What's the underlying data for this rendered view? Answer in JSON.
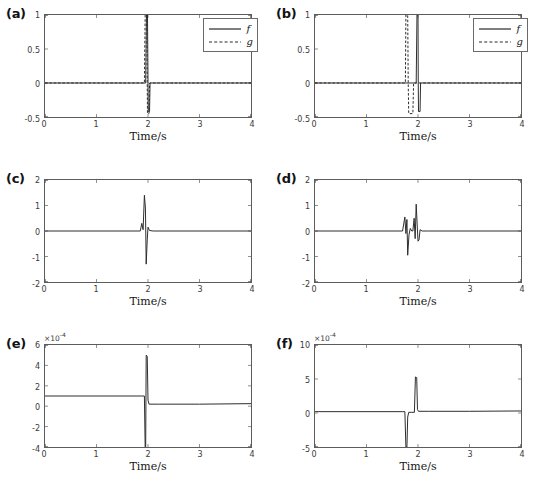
{
  "figure": {
    "background_color": "#ffffff",
    "line_color": "#2b2b2b",
    "axis_color": "#5c5c5c",
    "panel_count": 6,
    "shared_xlabel": "Time/s"
  },
  "chart_data": [
    {
      "type": "line",
      "panel": "(a)",
      "title": "",
      "xlabel": "Time/s",
      "ylabel": "",
      "xlim": [
        0,
        4
      ],
      "ylim": [
        -0.5,
        1
      ],
      "xticks": [
        "0",
        "1",
        "2",
        "3",
        "4"
      ],
      "xtick_values": [
        0,
        1,
        2,
        3,
        4
      ],
      "yticks": [
        "1",
        "0.5",
        "0",
        "-0.5"
      ],
      "ytick_values": [
        1,
        0.5,
        0,
        -0.5
      ],
      "grid": false,
      "exponent": "",
      "legend": {
        "position": "upper-right",
        "entries": [
          {
            "label": "f",
            "style": "solid"
          },
          {
            "label": "g",
            "style": "dashed"
          }
        ]
      },
      "series": [
        {
          "name": "f",
          "style": "solid",
          "description": "Flat zero baseline with a narrow clipped impulse at t=2.0; rises beyond +1 (clipped at axis top) then swings to about -0.42 before returning to zero.",
          "points": [
            [
              0.0,
              0.0
            ],
            [
              1.9,
              0.0
            ],
            [
              1.955,
              0.0
            ],
            [
              1.97,
              1.0
            ],
            [
              1.99,
              1.0
            ],
            [
              2.0,
              0.02
            ],
            [
              2.005,
              -0.42
            ],
            [
              2.03,
              -0.42
            ],
            [
              2.04,
              0.0
            ],
            [
              2.2,
              0.0
            ],
            [
              4.0,
              0.0
            ]
          ]
        },
        {
          "name": "g",
          "style": "dashed",
          "description": "Nearly coincident with f; narrow clipped impulse centred at t=1.96 reaching beyond +1 and dipping to about -0.45.",
          "points": [
            [
              0.0,
              0.0
            ],
            [
              1.88,
              0.0
            ],
            [
              1.93,
              0.0
            ],
            [
              1.945,
              1.0
            ],
            [
              1.975,
              1.0
            ],
            [
              1.985,
              0.0
            ],
            [
              1.99,
              -0.45
            ],
            [
              2.02,
              -0.45
            ],
            [
              2.03,
              0.0
            ],
            [
              2.2,
              0.0
            ],
            [
              4.0,
              0.0
            ]
          ]
        }
      ]
    },
    {
      "type": "line",
      "panel": "(b)",
      "title": "",
      "xlabel": "Time/s",
      "ylabel": "",
      "xlim": [
        0,
        4
      ],
      "ylim": [
        -0.5,
        1
      ],
      "xticks": [
        "0",
        "1",
        "2",
        "3",
        "4"
      ],
      "xtick_values": [
        0,
        1,
        2,
        3,
        4
      ],
      "yticks": [
        "1",
        "0.5",
        "0",
        "-0.5"
      ],
      "ytick_values": [
        1,
        0.5,
        0,
        -0.5
      ],
      "grid": false,
      "exponent": "",
      "legend": {
        "position": "upper-right",
        "entries": [
          {
            "label": "f",
            "style": "solid"
          },
          {
            "label": "g",
            "style": "dashed"
          }
        ]
      },
      "series": [
        {
          "name": "f",
          "style": "solid",
          "description": "Zero baseline with clipped impulse at t=2.0 reaching past +1 then dipping to about -0.42.",
          "points": [
            [
              0.0,
              0.0
            ],
            [
              1.93,
              0.0
            ],
            [
              1.965,
              0.0
            ],
            [
              1.98,
              1.0
            ],
            [
              2.0,
              1.0
            ],
            [
              2.005,
              0.0
            ],
            [
              2.01,
              -0.42
            ],
            [
              2.04,
              -0.42
            ],
            [
              2.05,
              0.0
            ],
            [
              2.25,
              0.0
            ],
            [
              4.0,
              0.0
            ]
          ]
        },
        {
          "name": "g",
          "style": "dashed",
          "description": "Time-shifted copy of f; clipped impulse centred near t=1.80, reaching past +1 then oscillating down to about -0.45 between t=1.80 and t=1.92.",
          "points": [
            [
              0.0,
              0.0
            ],
            [
              1.72,
              0.0
            ],
            [
              1.755,
              0.0
            ],
            [
              1.765,
              1.0
            ],
            [
              1.8,
              1.0
            ],
            [
              1.81,
              0.0
            ],
            [
              1.82,
              -0.45
            ],
            [
              1.9,
              -0.45
            ],
            [
              1.915,
              0.0
            ],
            [
              2.1,
              0.0
            ],
            [
              4.0,
              0.0
            ]
          ]
        }
      ]
    },
    {
      "type": "line",
      "panel": "(c)",
      "title": "",
      "xlabel": "Time/s",
      "ylabel": "",
      "xlim": [
        0,
        4
      ],
      "ylim": [
        -2,
        2
      ],
      "xticks": [
        "0",
        "1",
        "2",
        "3",
        "4"
      ],
      "xtick_values": [
        0,
        1,
        2,
        3,
        4
      ],
      "yticks": [
        "2",
        "1",
        "0",
        "-1",
        "-2"
      ],
      "ytick_values": [
        2,
        1,
        0,
        -1,
        -2
      ],
      "grid": false,
      "exponent": "",
      "legend": null,
      "series": [
        {
          "name": "c",
          "style": "solid",
          "description": "Flat zero baseline then a single oscillatory transient near t=1.95: small positive lobe of 0.3, main positive peak of 1.4, deep negative trough of -1.3, small recovery lobe of 0.15, back to zero.",
          "points": [
            [
              0.0,
              0.0
            ],
            [
              1.85,
              0.0
            ],
            [
              1.88,
              0.3
            ],
            [
              1.905,
              0.05
            ],
            [
              1.93,
              1.4
            ],
            [
              1.95,
              0.9
            ],
            [
              1.965,
              -1.3
            ],
            [
              1.985,
              -0.35
            ],
            [
              2.0,
              0.15
            ],
            [
              2.03,
              0.02
            ],
            [
              2.1,
              0.0
            ],
            [
              4.0,
              0.0
            ]
          ]
        }
      ]
    },
    {
      "type": "line",
      "panel": "(d)",
      "title": "",
      "xlabel": "Time/s",
      "ylabel": "",
      "xlim": [
        0,
        4
      ],
      "ylim": [
        -2,
        2
      ],
      "xticks": [
        "0",
        "1",
        "2",
        "3",
        "4"
      ],
      "xtick_values": [
        0,
        1,
        2,
        3,
        4
      ],
      "yticks": [
        "2",
        "1",
        "0",
        "-1",
        "-2"
      ],
      "ytick_values": [
        2,
        1,
        0,
        -1,
        -2
      ],
      "grid": false,
      "exponent": "",
      "legend": null,
      "series": [
        {
          "name": "d",
          "style": "solid",
          "description": "Two separated oscillatory bursts: first near t=1.78 peaking at 0.55 then dropping to -0.95; second near t=1.97 peaking at 1.05 then dropping to -0.40, both returning to the zero baseline.",
          "points": [
            [
              0.0,
              0.0
            ],
            [
              1.7,
              0.0
            ],
            [
              1.745,
              0.55
            ],
            [
              1.765,
              -0.1
            ],
            [
              1.785,
              0.45
            ],
            [
              1.8,
              -0.95
            ],
            [
              1.825,
              -0.15
            ],
            [
              1.85,
              0.1
            ],
            [
              1.88,
              0.0
            ],
            [
              1.9,
              0.0
            ],
            [
              1.925,
              0.5
            ],
            [
              1.945,
              -0.3
            ],
            [
              1.965,
              1.05
            ],
            [
              1.985,
              0.2
            ],
            [
              2.0,
              -0.4
            ],
            [
              2.02,
              -0.35
            ],
            [
              2.04,
              0.05
            ],
            [
              2.08,
              0.0
            ],
            [
              2.2,
              0.0
            ],
            [
              4.0,
              0.0
            ]
          ]
        }
      ]
    },
    {
      "type": "line",
      "panel": "(e)",
      "title": "",
      "xlabel": "Time/s",
      "ylabel": "",
      "xlim": [
        0,
        4
      ],
      "ylim": [
        -4,
        6
      ],
      "xticks": [
        "0",
        "1",
        "2",
        "3",
        "4"
      ],
      "xtick_values": [
        0,
        1,
        2,
        3,
        4
      ],
      "yticks": [
        "6",
        "4",
        "2",
        "0",
        "-2",
        "-4"
      ],
      "ytick_values": [
        6,
        4,
        2,
        0,
        -2,
        -4
      ],
      "grid": false,
      "exponent": "×10⁻⁴",
      "exponent_base": "10",
      "exponent_power": "-4",
      "legend": null,
      "series": [
        {
          "name": "e",
          "style": "solid",
          "description": "Constant plateau near 1e-4 from t=0 to t=1.9, then a sharp drop to -4e-4 at t=1.95, an immediate spike up to 5e-4 at t=1.97, then settling to a low plateau near 0.2e-4 for the rest of the record.",
          "points": [
            [
              0.0,
              1.0
            ],
            [
              1.88,
              1.0
            ],
            [
              1.93,
              1.0
            ],
            [
              1.945,
              -4.0
            ],
            [
              1.955,
              -4.0
            ],
            [
              1.965,
              5.0
            ],
            [
              1.985,
              4.9
            ],
            [
              2.0,
              0.6
            ],
            [
              2.02,
              0.2
            ],
            [
              2.2,
              0.2
            ],
            [
              3.0,
              0.2
            ],
            [
              4.0,
              0.25
            ]
          ]
        }
      ]
    },
    {
      "type": "line",
      "panel": "(f)",
      "title": "",
      "xlabel": "Time/s",
      "ylabel": "",
      "xlim": [
        0,
        4
      ],
      "ylim": [
        -5,
        10
      ],
      "xticks": [
        "0",
        "1",
        "2",
        "3",
        "4"
      ],
      "xtick_values": [
        0,
        1,
        2,
        3,
        4
      ],
      "yticks": [
        "10",
        "5",
        "0",
        "-5"
      ],
      "ytick_values": [
        10,
        5,
        0,
        -5
      ],
      "grid": false,
      "exponent": "×10⁻⁴",
      "exponent_base": "10",
      "exponent_power": "-4",
      "legend": null,
      "series": [
        {
          "name": "f",
          "style": "solid",
          "description": "Near-zero baseline at about 0.2e-4 with a sharp negative excursion to -5e-4 at t=1.78 and a positive spike to 5.3e-4 at t=1.97, returning to the baseline afterwards.",
          "points": [
            [
              0.0,
              0.2
            ],
            [
              1.7,
              0.2
            ],
            [
              1.745,
              0.2
            ],
            [
              1.765,
              -5.0
            ],
            [
              1.785,
              -5.0
            ],
            [
              1.8,
              -0.6
            ],
            [
              1.82,
              0.1
            ],
            [
              1.88,
              0.1
            ],
            [
              1.93,
              0.1
            ],
            [
              1.95,
              5.3
            ],
            [
              1.975,
              5.2
            ],
            [
              1.99,
              0.5
            ],
            [
              2.01,
              0.25
            ],
            [
              2.2,
              0.25
            ],
            [
              3.0,
              0.25
            ],
            [
              4.0,
              0.3
            ]
          ]
        }
      ]
    }
  ]
}
